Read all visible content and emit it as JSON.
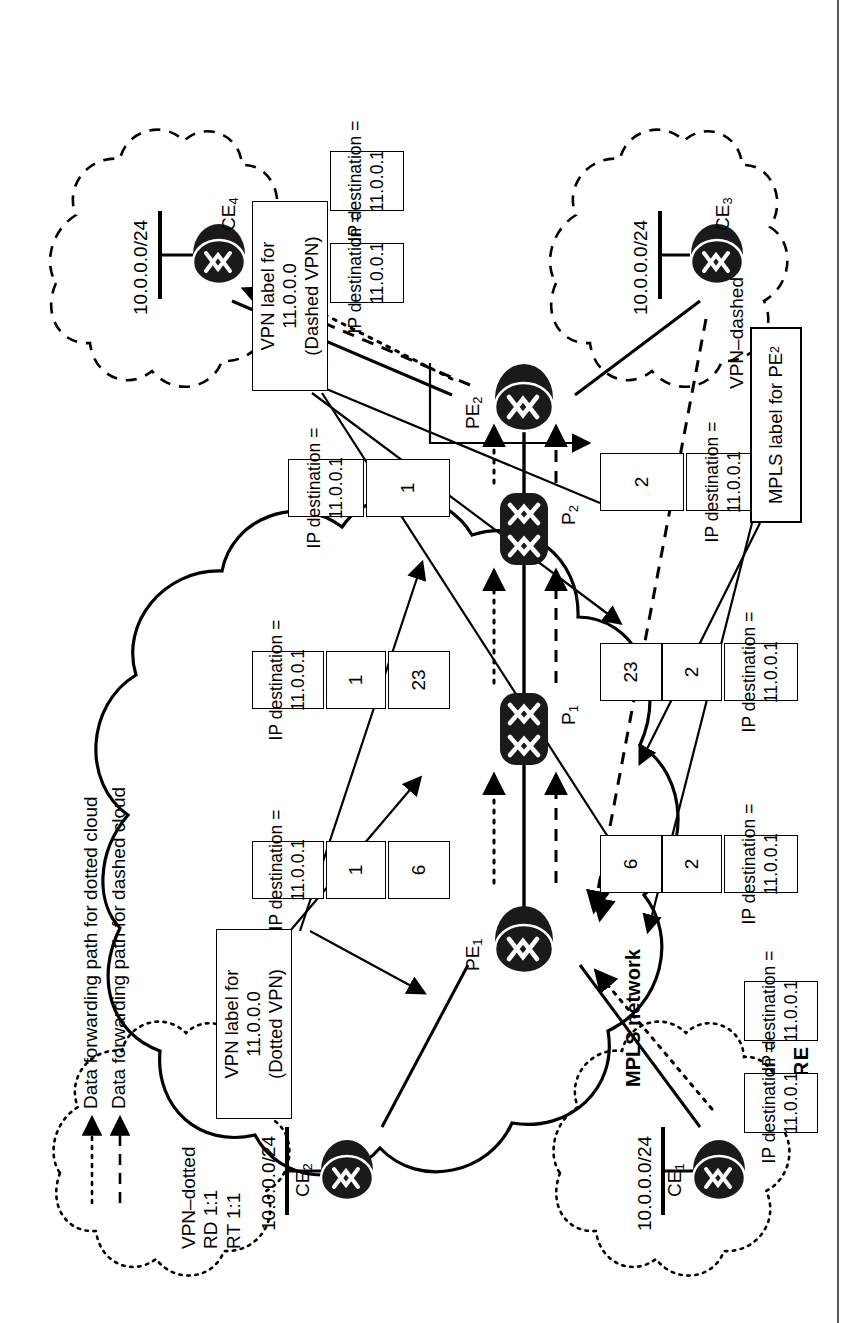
{
  "figure": {
    "caption": "FIGURE 12.9"
  },
  "diagram": {
    "core_label": "MPLS network",
    "vpn_dotted": {
      "line1": "VPN–dotted",
      "line2": "RD 1:1",
      "line3": "RT 1:1"
    },
    "vpn_dashed": {
      "line1": "VPN–dashed",
      "line2": "RD 1:2",
      "line3": "RT 1:2"
    },
    "routers": {
      "ce1": "CE",
      "ce1_sub": "1",
      "ce2": "CE",
      "ce2_sub": "2",
      "ce3": "CE",
      "ce3_sub": "3",
      "ce4": "CE",
      "ce4_sub": "4",
      "pe1": "PE",
      "pe1_sub": "1",
      "pe2": "PE",
      "pe2_sub": "2",
      "p1": "P",
      "p1_sub": "1",
      "p2": "P",
      "p2_sub": "2"
    },
    "subnets": {
      "ce1": "10.0.0.0/24",
      "ce2": "10.0.0.0/24",
      "ce3": "10.0.0.0/24",
      "ce4": "10.0.0.0/24"
    },
    "ip_packet": {
      "line1": "IP destination =",
      "line2": "11.0.0.1"
    },
    "label_stacks": {
      "dotted_hop1": [
        "6",
        "1"
      ],
      "dotted_hop2": [
        "23",
        "1"
      ],
      "dotted_hop3": [
        "1"
      ],
      "dashed_hop1": [
        "6",
        "2"
      ],
      "dashed_hop2": [
        "23",
        "2"
      ],
      "dashed_hop3": [
        "2"
      ]
    },
    "callouts": {
      "vpn_label_dotted": {
        "line1": "VPN label for 11.0.0.0",
        "line2": "(Dotted VPN)"
      },
      "vpn_label_dashed": {
        "line1": "VPN label for 11.0.0.0",
        "line2": "(Dashed VPN)"
      },
      "mpls_label_pe2": {
        "line1": "MPLS label for PE",
        "sub": "2"
      }
    },
    "legend": [
      {
        "style": "dotted",
        "text": "Data forwarding path for dotted cloud"
      },
      {
        "style": "dashed",
        "text": "Data forwarding path for dashed cloud"
      }
    ]
  }
}
